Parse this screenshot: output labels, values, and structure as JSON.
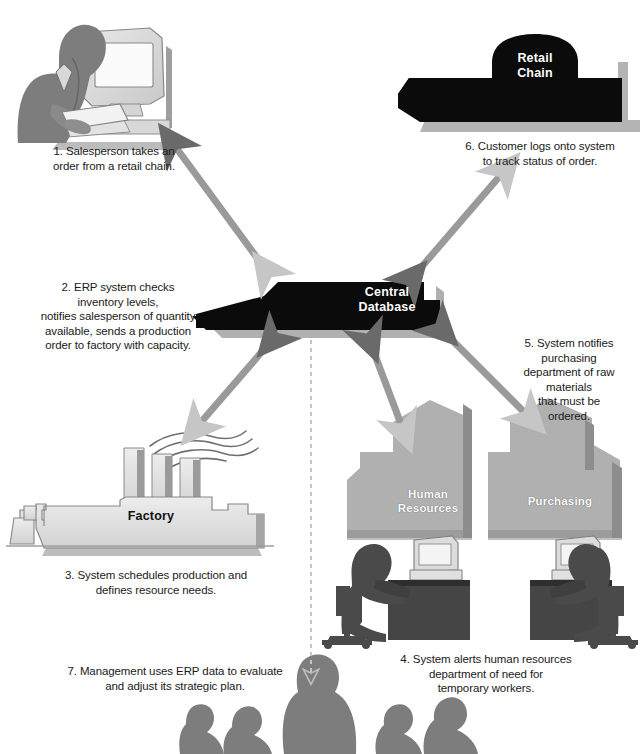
{
  "diagram": {
    "colors": {
      "background": "#ffffff",
      "black_building": "#0b0b0b",
      "grey_building": "#a9a9a9",
      "grey_building_shadow": "#8a8a8a",
      "figure_grey": "#7d7d7d",
      "figure_dark": "#4a4a4a",
      "arrow_grey": "#9a9a9a",
      "arrow_dark": "#6e6e6e",
      "light_machine": "#dcdcdc",
      "text": "#1a1a1a",
      "label_white": "#ffffff"
    }
  },
  "nodes": {
    "central_database": {
      "label": "Central\nDatabase",
      "style": "black"
    },
    "retail_chain": {
      "label": "Retail\nChain",
      "style": "black"
    },
    "factory": {
      "label": "Factory",
      "style": "light"
    },
    "human_resources": {
      "label": "Human\nResources",
      "style": "grey"
    },
    "purchasing": {
      "label": "Purchasing",
      "style": "grey"
    }
  },
  "steps": [
    {
      "id": "step1",
      "number": "1.",
      "text": "1. Salesperson takes an\norder from a retail chain."
    },
    {
      "id": "step2",
      "number": "2.",
      "text": "2. ERP system checks\ninventory levels,\nnotifies salesperson of quantity\navailable, sends a production\norder to factory with capacity."
    },
    {
      "id": "step3",
      "number": "3.",
      "text": "3. System schedules production and\ndefines resource needs."
    },
    {
      "id": "step4",
      "number": "4.",
      "text": "4. System alerts human resources\ndepartment of need for\ntemporary workers."
    },
    {
      "id": "step5",
      "number": "5.",
      "text": "5. System notifies\npurchasing\ndepartment of raw\nmaterials\nthat must be\nordered."
    },
    {
      "id": "step6",
      "number": "6.",
      "text": "6. Customer logs onto system\nto track status of order."
    },
    {
      "id": "step7",
      "number": "7.",
      "text": "7. Management uses ERP data to evaluate\nand adjust its strategic plan."
    }
  ],
  "connectors": [
    {
      "id": "arrow-salesperson-database",
      "from": "salesperson",
      "to": "central_database",
      "style": "double-headed-solid"
    },
    {
      "id": "arrow-retailchain-database",
      "from": "retail_chain",
      "to": "central_database",
      "style": "double-headed-solid"
    },
    {
      "id": "arrow-factory-database",
      "from": "factory",
      "to": "central_database",
      "style": "double-headed-solid"
    },
    {
      "id": "arrow-hr-database",
      "from": "human_resources",
      "to": "central_database",
      "style": "double-headed-solid"
    },
    {
      "id": "arrow-purchasing-database",
      "from": "purchasing",
      "to": "central_database",
      "style": "double-headed-solid"
    },
    {
      "id": "arrow-database-management",
      "from": "central_database",
      "to": "management_group",
      "style": "dashed-single-headed"
    }
  ],
  "figures": {
    "salesperson": "salesperson-at-computer",
    "hr_worker": "seated-worker-at-desk",
    "purchasing_worker": "seated-worker-at-desk",
    "management_group": "group-of-five-people"
  }
}
